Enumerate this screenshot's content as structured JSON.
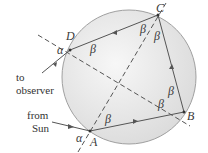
{
  "diagram": {
    "points": {
      "A": {
        "label": "A",
        "x": 90,
        "y": 131
      },
      "B": {
        "label": "B",
        "x": 184,
        "y": 112
      },
      "C": {
        "label": "C",
        "x": 158,
        "y": 15
      },
      "D": {
        "label": "D",
        "x": 70,
        "y": 50
      }
    },
    "angles": {
      "alpha": "α",
      "beta": "β"
    },
    "labels": {
      "to_observer_line1": "to",
      "to_observer_line2": "observer",
      "from_sun_line1": "from",
      "from_sun_line2": "Sun"
    },
    "colors": {
      "drop_fill": "#e6e6e6",
      "drop_stroke": "#9a9a9a",
      "ray": "#555555",
      "text": "#333333"
    }
  }
}
